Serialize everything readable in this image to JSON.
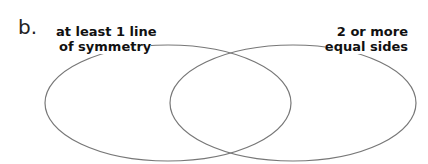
{
  "item_label": "b.",
  "venn": {
    "left_set": {
      "line1": "at least 1 line",
      "line2": "of symmetry"
    },
    "right_set": {
      "line1": "2 or more",
      "line2": "equal sides"
    }
  },
  "colors": {
    "stroke": "#777777",
    "text": "#111111"
  }
}
